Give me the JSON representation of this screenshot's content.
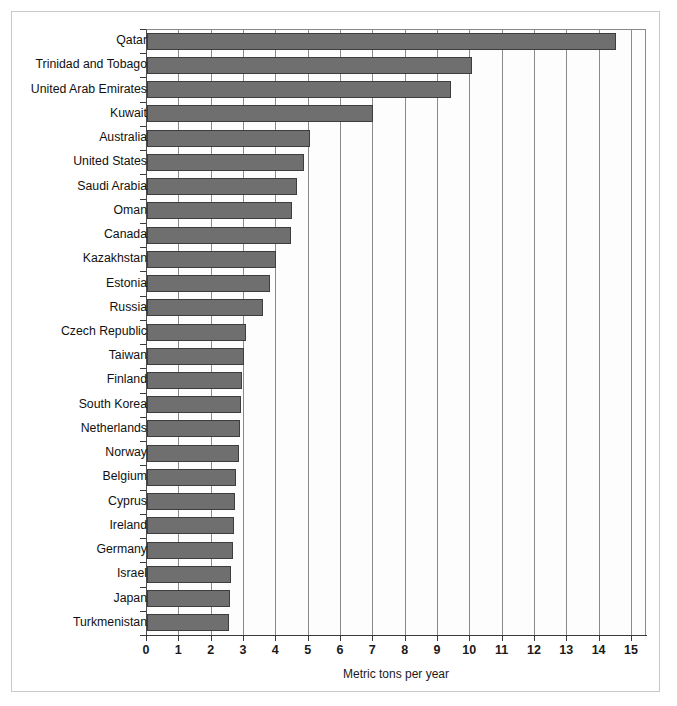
{
  "figure": {
    "background_color": "#ffffff",
    "frame_color": "#c9c9c9",
    "bar_color": "#6f6f6f",
    "bar_edge_color": "#3d3d3d",
    "axis_color": "#3a3a3a",
    "grid_color": "#8a8a8a"
  },
  "chart_data": {
    "type": "bar",
    "orientation": "horizontal",
    "title": "",
    "subtitle": "",
    "xlabel": "Metric tons per year",
    "ylabel": "",
    "xlim": [
      0,
      15.45
    ],
    "ylim": [
      0,
      25
    ],
    "grid": true,
    "grid_axis": "x",
    "legend": false,
    "legend_position": "none",
    "xticks": [
      0,
      1,
      2,
      3,
      4,
      5,
      6,
      7,
      8,
      9,
      10,
      11,
      12,
      13,
      14,
      15
    ],
    "xticklabels": [
      "0",
      "1",
      "2",
      "3",
      "4",
      "5",
      "6",
      "7",
      "8",
      "9",
      "10",
      "11",
      "12",
      "13",
      "14",
      "15"
    ],
    "categories": [
      "Qatar",
      "Trinidad and Tobago",
      "United Arab Emirates",
      "Kuwait",
      "Australia",
      "United States",
      "Saudi Arabia",
      "Oman",
      "Canada",
      "Kazakhstan",
      "Estonia",
      "Russia",
      "Czech Republic",
      "Taiwan",
      "Finland",
      "South Korea",
      "Netherlands",
      "Norway",
      "Belgium",
      "Cyprus",
      "Ireland",
      "Germany",
      "Israel",
      "Japan",
      "Turkmenistan"
    ],
    "values": [
      14.5,
      10.05,
      9.4,
      7.0,
      5.05,
      4.85,
      4.65,
      4.5,
      4.45,
      4.0,
      3.8,
      3.6,
      3.05,
      3.0,
      2.95,
      2.9,
      2.88,
      2.85,
      2.75,
      2.72,
      2.7,
      2.65,
      2.6,
      2.58,
      2.55
    ]
  }
}
